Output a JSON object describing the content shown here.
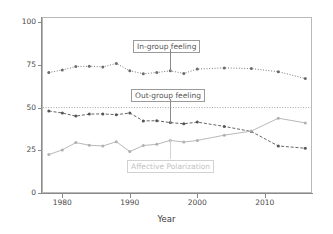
{
  "chart_data": {
    "type": "line",
    "title": "",
    "xlabel": "Year",
    "ylabel": "",
    "xlim": [
      1977,
      2017
    ],
    "ylim": [
      0,
      103
    ],
    "grid": false,
    "legend_position": "inline-annotations",
    "yticks": [
      0,
      25,
      50,
      75,
      100
    ],
    "ytick_labels": [
      "0",
      "25",
      "50",
      "75",
      "100"
    ],
    "xticks": [
      1980,
      1990,
      2000,
      2010
    ],
    "xtick_labels": [
      "1980",
      "1990",
      "2000",
      "2010"
    ],
    "reference_lines": [
      {
        "name": "fifty-line",
        "axis": "y",
        "value": 50,
        "style": "dotted",
        "color": "#9a9a9a"
      }
    ],
    "x": [
      1978,
      1980,
      1982,
      1984,
      1986,
      1988,
      1990,
      1992,
      1994,
      1996,
      1998,
      2000,
      2004,
      2008,
      2012,
      2016
    ],
    "series": [
      {
        "name": "In-group feeling",
        "color": "#6b6b6b",
        "marker": "circle",
        "linestyle": "dotted",
        "values": [
          70.5,
          72.0,
          74.0,
          74.2,
          73.8,
          75.8,
          71.5,
          69.8,
          70.5,
          71.5,
          70.0,
          72.5,
          73.2,
          72.8,
          71.0,
          67.0
        ]
      },
      {
        "name": "Out-group feeling",
        "color": "#555555",
        "marker": "circle",
        "linestyle": "dashed",
        "values": [
          48.0,
          46.8,
          45.0,
          46.2,
          46.3,
          45.8,
          46.8,
          42.2,
          42.3,
          41.2,
          40.5,
          41.5,
          39.0,
          36.0,
          27.5,
          26.2
        ]
      },
      {
        "name": "Affective Polarization",
        "color": "#b0b0b0",
        "marker": "circle",
        "linestyle": "solid",
        "values": [
          22.5,
          25.2,
          29.5,
          28.0,
          27.5,
          30.0,
          24.2,
          27.8,
          28.5,
          30.8,
          29.8,
          30.8,
          33.8,
          36.2,
          43.8,
          41.0
        ]
      }
    ],
    "annotations": [
      {
        "name": "in-group-feeling",
        "label": "In-group feeling",
        "target_x": 1996,
        "target_y": 71.5,
        "faded": false
      },
      {
        "name": "out-group-feeling",
        "label": "Out-group feeling",
        "target_x": 1996,
        "target_y": 41.2,
        "faded": false
      },
      {
        "name": "affective-polarization",
        "label": "Affective Polarization",
        "target_x": 1996,
        "target_y": 30.8,
        "faded": true
      }
    ]
  }
}
